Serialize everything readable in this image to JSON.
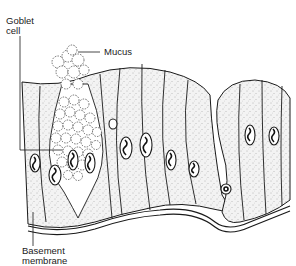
{
  "diagram": {
    "labels": {
      "goblet_cell_line1": "Goblet",
      "goblet_cell_line2": "cell",
      "mucus": "Mucus",
      "basement_membrane_line1": "Basement",
      "basement_membrane_line2": "membrane"
    },
    "colors": {
      "ink": "#1a1a1a",
      "cytoplasm": "#f1f1f1",
      "background": "#ffffff"
    }
  }
}
